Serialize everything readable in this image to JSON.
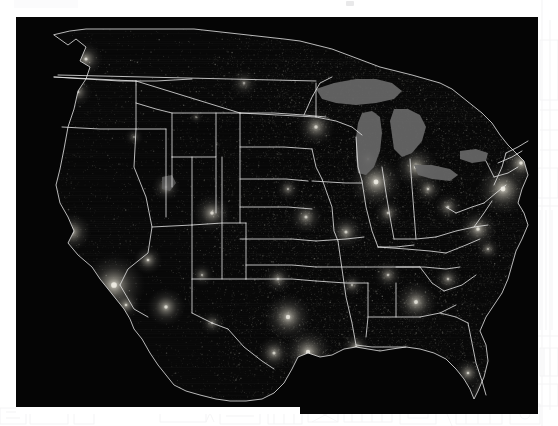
{
  "page": {
    "background_color": "#ffffff",
    "header_band_color": "#fbfbfc",
    "mark_color": "#e9e9ea"
  },
  "figure": {
    "caption": "",
    "type": "satellite-nighttime-lights-map",
    "background_color": "#050505",
    "ocean_color": "#000000",
    "boundary_color": "#e8e8e8",
    "lights_color": "#d8d4c8",
    "lake_color": "#6b6b6b",
    "bounds_px": {
      "x": 16,
      "y": 17,
      "width": 522,
      "height": 397
    },
    "region": "Contiguous United States",
    "features": {
      "state_boundaries": true,
      "coastlines": true,
      "great_lakes": true,
      "urban_light_clusters": true
    },
    "major_light_clusters": [
      {
        "name": "Los Angeles",
        "x": 98,
        "y": 268,
        "radius": 13,
        "intensity": 0.95
      },
      {
        "name": "San Francisco Bay",
        "x": 56,
        "y": 215,
        "radius": 8,
        "intensity": 0.8
      },
      {
        "name": "San Diego",
        "x": 110,
        "y": 288,
        "radius": 6,
        "intensity": 0.7
      },
      {
        "name": "Seattle",
        "x": 70,
        "y": 42,
        "radius": 7,
        "intensity": 0.75
      },
      {
        "name": "Portland",
        "x": 62,
        "y": 75,
        "radius": 6,
        "intensity": 0.6
      },
      {
        "name": "Las Vegas",
        "x": 132,
        "y": 243,
        "radius": 6,
        "intensity": 0.72
      },
      {
        "name": "Phoenix",
        "x": 150,
        "y": 290,
        "radius": 8,
        "intensity": 0.78
      },
      {
        "name": "Salt Lake City",
        "x": 150,
        "y": 170,
        "radius": 6,
        "intensity": 0.62
      },
      {
        "name": "Denver",
        "x": 196,
        "y": 196,
        "radius": 8,
        "intensity": 0.76
      },
      {
        "name": "Albuquerque",
        "x": 186,
        "y": 258,
        "radius": 5,
        "intensity": 0.55
      },
      {
        "name": "Dallas-Fort Worth",
        "x": 272,
        "y": 300,
        "radius": 10,
        "intensity": 0.85
      },
      {
        "name": "Houston",
        "x": 292,
        "y": 335,
        "radius": 10,
        "intensity": 0.85
      },
      {
        "name": "San Antonio",
        "x": 258,
        "y": 336,
        "radius": 7,
        "intensity": 0.7
      },
      {
        "name": "Kansas City",
        "x": 290,
        "y": 200,
        "radius": 7,
        "intensity": 0.68
      },
      {
        "name": "Minneapolis",
        "x": 300,
        "y": 110,
        "radius": 8,
        "intensity": 0.74
      },
      {
        "name": "Chicago",
        "x": 360,
        "y": 165,
        "radius": 11,
        "intensity": 0.92
      },
      {
        "name": "St. Louis",
        "x": 330,
        "y": 215,
        "radius": 7,
        "intensity": 0.7
      },
      {
        "name": "Detroit",
        "x": 400,
        "y": 150,
        "radius": 9,
        "intensity": 0.82
      },
      {
        "name": "Atlanta",
        "x": 400,
        "y": 285,
        "radius": 9,
        "intensity": 0.8
      },
      {
        "name": "Miami",
        "x": 470,
        "y": 375,
        "radius": 7,
        "intensity": 0.78
      },
      {
        "name": "Tampa",
        "x": 452,
        "y": 356,
        "radius": 6,
        "intensity": 0.7
      },
      {
        "name": "New Orleans",
        "x": 340,
        "y": 330,
        "radius": 6,
        "intensity": 0.68
      },
      {
        "name": "Washington DC",
        "x": 462,
        "y": 212,
        "radius": 8,
        "intensity": 0.82
      },
      {
        "name": "New York",
        "x": 487,
        "y": 172,
        "radius": 11,
        "intensity": 0.95
      },
      {
        "name": "Boston",
        "x": 505,
        "y": 146,
        "radius": 8,
        "intensity": 0.85
      },
      {
        "name": "Pittsburgh",
        "x": 432,
        "y": 190,
        "radius": 6,
        "intensity": 0.62
      },
      {
        "name": "Nashville",
        "x": 372,
        "y": 258,
        "radius": 6,
        "intensity": 0.6
      },
      {
        "name": "Oklahoma City",
        "x": 262,
        "y": 262,
        "radius": 6,
        "intensity": 0.62
      },
      {
        "name": "Omaha",
        "x": 272,
        "y": 172,
        "radius": 5,
        "intensity": 0.55
      },
      {
        "name": "Charlotte",
        "x": 432,
        "y": 262,
        "radius": 6,
        "intensity": 0.6
      },
      {
        "name": "Norfolk",
        "x": 472,
        "y": 232,
        "radius": 5,
        "intensity": 0.58
      },
      {
        "name": "Cleveland",
        "x": 412,
        "y": 172,
        "radius": 6,
        "intensity": 0.66
      },
      {
        "name": "Indianapolis",
        "x": 372,
        "y": 196,
        "radius": 6,
        "intensity": 0.6
      },
      {
        "name": "Memphis",
        "x": 336,
        "y": 268,
        "radius": 5,
        "intensity": 0.58
      },
      {
        "name": "Milwaukee",
        "x": 352,
        "y": 142,
        "radius": 5,
        "intensity": 0.58
      },
      {
        "name": "Boise",
        "x": 118,
        "y": 120,
        "radius": 4,
        "intensity": 0.42
      },
      {
        "name": "Billings",
        "x": 180,
        "y": 100,
        "radius": 3,
        "intensity": 0.34
      },
      {
        "name": "El Paso",
        "x": 196,
        "y": 306,
        "radius": 5,
        "intensity": 0.55
      },
      {
        "name": "Bakken Oil Field",
        "x": 228,
        "y": 66,
        "radius": 6,
        "intensity": 0.45
      }
    ],
    "great_lakes": [
      {
        "name": "Lake Superior",
        "color": "#5e5e5e"
      },
      {
        "name": "Lake Michigan",
        "color": "#5e5e5e"
      },
      {
        "name": "Lake Huron",
        "color": "#5e5e5e"
      },
      {
        "name": "Lake Erie",
        "color": "#5e5e5e"
      },
      {
        "name": "Lake Ontario",
        "color": "#5e5e5e"
      }
    ]
  }
}
